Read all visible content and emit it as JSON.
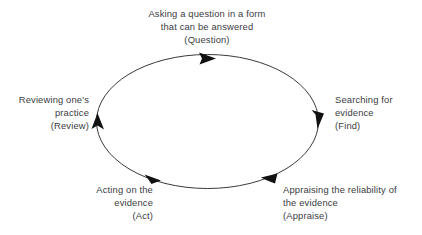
{
  "diagram": {
    "type": "cyclical-process-diagram",
    "direction": "clockwise",
    "shape": "ellipse",
    "colors": {
      "background": "#ffffff",
      "text": "#3b3b3f",
      "stroke": "#3a3a3a",
      "arrowhead": "#111111"
    },
    "stages": [
      {
        "id": "question",
        "position": "top",
        "description": "Asking a question in a form that can be answered",
        "line1": "Asking a question in a form",
        "line2": "that can be answered",
        "keyword": "(Question)",
        "text": "Asking a question in a form\nthat can be answered\n(Question)"
      },
      {
        "id": "find",
        "position": "right",
        "description": "Searching for evidence",
        "line1": "Searching for",
        "line2": "evidence",
        "keyword": "(Find)",
        "text": "Searching for\nevidence\n(Find)"
      },
      {
        "id": "appraise",
        "position": "bottom-right",
        "description": "Appraising the reliability of the evidence",
        "line1": "Appraising the reliability of",
        "line2": "the evidence",
        "keyword": "(Appraise)",
        "text": "Appraising the reliability of\nthe evidence\n(Appraise)"
      },
      {
        "id": "act",
        "position": "bottom-left",
        "description": "Acting on the evidence",
        "line1": "Acting on the",
        "line2": "evidence",
        "keyword": "(Act)",
        "text": "Acting on the\nevidence\n(Act)"
      },
      {
        "id": "review",
        "position": "left",
        "description": "Reviewing one's practice",
        "line1": "Reviewing one's",
        "line2": "practice",
        "keyword": "(Review)",
        "text": "Reviewing one's\npractice\n(Review)"
      }
    ],
    "arrows": [
      {
        "id": "arrow-top",
        "at": "top",
        "points": "right"
      },
      {
        "id": "arrow-right",
        "at": "right",
        "points": "down"
      },
      {
        "id": "arrow-bottom-right",
        "at": "bottom-right",
        "points": "left"
      },
      {
        "id": "arrow-bottom-left",
        "at": "bottom-left",
        "points": "left"
      },
      {
        "id": "arrow-left",
        "at": "left",
        "points": "up"
      }
    ]
  }
}
